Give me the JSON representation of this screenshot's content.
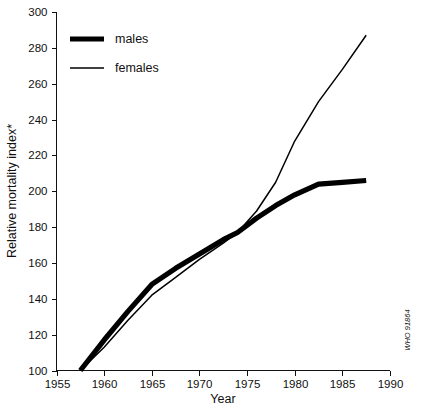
{
  "chart_data": {
    "type": "line",
    "title": "",
    "xlabel": "Year",
    "ylabel": "Relative mortality index*",
    "xlim": [
      1955,
      1990
    ],
    "ylim": [
      100,
      300
    ],
    "xticks": [
      1955,
      1960,
      1965,
      1970,
      1975,
      1980,
      1985,
      1990
    ],
    "yticks": [
      100,
      120,
      140,
      160,
      180,
      200,
      220,
      240,
      260,
      280,
      300
    ],
    "xtick_labels": [
      "1955",
      "1960",
      "1965",
      "1970",
      "1975",
      "1980",
      "1985",
      "1990"
    ],
    "ytick_labels": [
      "100",
      "120",
      "140",
      "160",
      "180",
      "200",
      "220",
      "240",
      "260",
      "280",
      "300"
    ],
    "grid": false,
    "legend_position": "top-left",
    "series": [
      {
        "name": "males",
        "style": "thick-solid-black",
        "x": [
          1957.5,
          1960,
          1962.5,
          1965,
          1967.5,
          1970,
          1972.5,
          1974,
          1976,
          1978,
          1980,
          1982.5,
          1985,
          1987.5
        ],
        "values": [
          100,
          117,
          133,
          148,
          157,
          165,
          173,
          177,
          185,
          192,
          198,
          204,
          205,
          206
        ]
      },
      {
        "name": "females",
        "style": "thin-solid-black",
        "x": [
          1957.5,
          1960,
          1962.5,
          1965,
          1967.5,
          1970,
          1972.5,
          1974,
          1976,
          1978,
          1980,
          1982.5,
          1985,
          1987.5
        ],
        "values": [
          100,
          113,
          128,
          142,
          152,
          162,
          171,
          177,
          189,
          205,
          228,
          250,
          268,
          287
        ]
      }
    ],
    "annotations": [
      {
        "name": "source-credit",
        "text": "WHO 91864",
        "position": "right-edge-vertical"
      }
    ]
  },
  "legend": {
    "items": [
      {
        "label": "males"
      },
      {
        "label": "females"
      }
    ]
  },
  "axes": {
    "x_title": "Year",
    "y_title": "Relative mortality index*"
  },
  "credit": {
    "text": "WHO 91864"
  },
  "colors": {
    "line": "#000000",
    "axis": "#111111",
    "background": "#ffffff"
  }
}
